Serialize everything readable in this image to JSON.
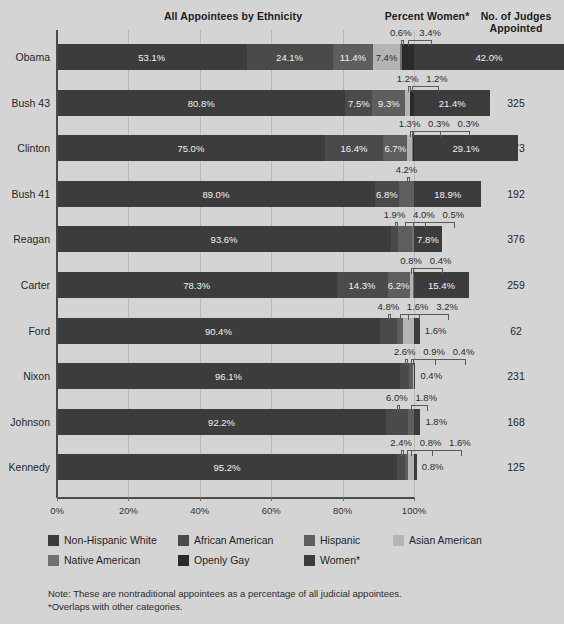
{
  "headers": {
    "ethnicity": "All Appointees by Ethnicity",
    "women": "Percent Women*",
    "judges_line1": "No. of Judges",
    "judges_line2": "Appointed"
  },
  "note": {
    "line1": "Note: These are nontraditional appointees as a percentage of all judicial appointees.",
    "line2": "*Overlaps with other categories."
  },
  "legend": [
    {
      "label": "Non-Hispanic White",
      "color": "#3c3c3c"
    },
    {
      "label": "African American",
      "color": "#4a4a4a"
    },
    {
      "label": "Hispanic",
      "color": "#5e5e5e"
    },
    {
      "label": "Asian American",
      "color": "#b4b4b4"
    },
    {
      "label": "Native American",
      "color": "#707070"
    },
    {
      "label": "Openly Gay",
      "color": "#2a2a2a"
    },
    {
      "label": "Women*",
      "color": "#3c3c3c"
    }
  ],
  "axis": {
    "ticks": [
      "0%",
      "20%",
      "40%",
      "60%",
      "80%",
      "100%"
    ],
    "values": [
      0,
      20,
      40,
      60,
      80,
      100
    ]
  },
  "chart_data": {
    "type": "bar",
    "title": "All Appointees by Ethnicity",
    "xlabel": "",
    "ylabel": "",
    "xlim": [
      0,
      100
    ],
    "grid": true,
    "legend_position": "bottom",
    "categories": [
      "Obama",
      "Bush 43",
      "Clinton",
      "Bush 41",
      "Reagan",
      "Carter",
      "Ford",
      "Nixon",
      "Johnson",
      "Kennedy"
    ],
    "series": [
      {
        "name": "Non-Hispanic White",
        "values": [
          53.1,
          80.8,
          75.0,
          89.0,
          93.6,
          78.3,
          90.4,
          96.1,
          92.2,
          95.2
        ]
      },
      {
        "name": "African American",
        "values": [
          24.1,
          7.5,
          16.4,
          6.8,
          1.9,
          14.3,
          4.8,
          2.6,
          6.0,
          2.4
        ]
      },
      {
        "name": "Hispanic",
        "values": [
          11.4,
          9.3,
          6.7,
          4.2,
          4.0,
          6.2,
          1.6,
          0.9,
          1.8,
          0.8
        ]
      },
      {
        "name": "Asian American",
        "values": [
          7.4,
          1.2,
          1.3,
          0.0,
          0.0,
          0.8,
          3.2,
          0.4,
          0.0,
          1.6
        ]
      },
      {
        "name": "Native American",
        "values": [
          0.6,
          0.0,
          0.3,
          0.0,
          0.5,
          0.4,
          0.0,
          0.0,
          0.0,
          0.0
        ]
      },
      {
        "name": "Openly Gay",
        "values": [
          3.4,
          1.2,
          0.3,
          0.0,
          0.0,
          0.0,
          0.0,
          0.0,
          0.0,
          0.0
        ]
      },
      {
        "name": "Women*",
        "values": [
          42.0,
          21.4,
          29.1,
          18.9,
          7.8,
          15.4,
          1.6,
          0.4,
          1.8,
          0.8
        ]
      }
    ],
    "judges_appointed": [
      329,
      325,
      373,
      192,
      376,
      259,
      62,
      231,
      168,
      125
    ]
  },
  "rows": [
    {
      "name": "Obama",
      "judges": "329",
      "segs": [
        {
          "label": "53.1%",
          "w": 53.1,
          "color": "#3c3c3c",
          "inside": true,
          "light": false
        },
        {
          "label": "24.1%",
          "w": 24.1,
          "color": "#4a4a4a",
          "inside": true,
          "light": false
        },
        {
          "label": "11.4%",
          "w": 11.4,
          "color": "#5e5e5e",
          "inside": true,
          "light": false
        },
        {
          "label": "7.4%",
          "w": 7.4,
          "color": "#b4b4b4",
          "inside": true,
          "light": true
        },
        {
          "label": "0.6%",
          "w": 0.6,
          "color": "#707070",
          "inside": false,
          "light": false
        },
        {
          "label": "3.4%",
          "w": 3.4,
          "color": "#2a2a2a",
          "inside": false,
          "light": false
        }
      ],
      "women": {
        "label": "42.0%",
        "w": 42.0,
        "inside": true
      }
    },
    {
      "name": "Bush 43",
      "judges": "325",
      "segs": [
        {
          "label": "80.8%",
          "w": 80.8,
          "color": "#3c3c3c",
          "inside": true,
          "light": false
        },
        {
          "label": "7.5%",
          "w": 7.5,
          "color": "#4a4a4a",
          "inside": true,
          "light": false
        },
        {
          "label": "9.3%",
          "w": 9.3,
          "color": "#5e5e5e",
          "inside": true,
          "light": false
        },
        {
          "label": "1.2%",
          "w": 1.2,
          "color": "#b4b4b4",
          "inside": false,
          "light": true
        },
        {
          "label": "1.2%",
          "w": 1.2,
          "color": "#2a2a2a",
          "inside": false,
          "light": false
        }
      ],
      "women": {
        "label": "21.4%",
        "w": 21.4,
        "inside": true
      }
    },
    {
      "name": "Clinton",
      "judges": "373",
      "segs": [
        {
          "label": "75.0%",
          "w": 75.0,
          "color": "#3c3c3c",
          "inside": true,
          "light": false
        },
        {
          "label": "16.4%",
          "w": 16.4,
          "color": "#4a4a4a",
          "inside": true,
          "light": false
        },
        {
          "label": "6.7%",
          "w": 6.7,
          "color": "#5e5e5e",
          "inside": true,
          "light": false
        },
        {
          "label": "1.3%",
          "w": 1.3,
          "color": "#b4b4b4",
          "inside": false,
          "light": true
        },
        {
          "label": "0.3%",
          "w": 0.3,
          "color": "#707070",
          "inside": false,
          "light": false
        },
        {
          "label": "0.3%",
          "w": 0.3,
          "color": "#2a2a2a",
          "inside": false,
          "light": false
        }
      ],
      "women": {
        "label": "29.1%",
        "w": 29.1,
        "inside": true
      }
    },
    {
      "name": "Bush 41",
      "judges": "192",
      "segs": [
        {
          "label": "89.0%",
          "w": 89.0,
          "color": "#3c3c3c",
          "inside": true,
          "light": false
        },
        {
          "label": "6.8%",
          "w": 6.8,
          "color": "#4a4a4a",
          "inside": true,
          "light": false
        },
        {
          "label": "4.2%",
          "w": 4.2,
          "color": "#5e5e5e",
          "inside": false,
          "light": false
        }
      ],
      "women": {
        "label": "18.9%",
        "w": 18.9,
        "inside": true
      }
    },
    {
      "name": "Reagan",
      "judges": "376",
      "segs": [
        {
          "label": "93.6%",
          "w": 93.6,
          "color": "#3c3c3c",
          "inside": true,
          "light": false
        },
        {
          "label": "1.9%",
          "w": 1.9,
          "color": "#4a4a4a",
          "inside": false,
          "light": false
        },
        {
          "label": "4.0%",
          "w": 4.0,
          "color": "#5e5e5e",
          "inside": false,
          "light": false
        },
        {
          "label": "0.5%",
          "w": 0.5,
          "color": "#707070",
          "inside": false,
          "light": false
        }
      ],
      "women": {
        "label": "7.8%",
        "w": 7.8,
        "inside": true
      }
    },
    {
      "name": "Carter",
      "judges": "259",
      "segs": [
        {
          "label": "78.3%",
          "w": 78.3,
          "color": "#3c3c3c",
          "inside": true,
          "light": false
        },
        {
          "label": "14.3%",
          "w": 14.3,
          "color": "#4a4a4a",
          "inside": true,
          "light": false
        },
        {
          "label": "6.2%",
          "w": 6.2,
          "color": "#5e5e5e",
          "inside": true,
          "light": false
        },
        {
          "label": "0.8%",
          "w": 0.8,
          "color": "#b4b4b4",
          "inside": false,
          "light": true
        },
        {
          "label": "0.4%",
          "w": 0.4,
          "color": "#707070",
          "inside": false,
          "light": false
        }
      ],
      "women": {
        "label": "15.4%",
        "w": 15.4,
        "inside": true
      }
    },
    {
      "name": "Ford",
      "judges": "62",
      "segs": [
        {
          "label": "90.4%",
          "w": 90.4,
          "color": "#3c3c3c",
          "inside": true,
          "light": false
        },
        {
          "label": "4.8%",
          "w": 4.8,
          "color": "#4a4a4a",
          "inside": false,
          "light": false
        },
        {
          "label": "1.6%",
          "w": 1.6,
          "color": "#5e5e5e",
          "inside": false,
          "light": false
        },
        {
          "label": "3.2%",
          "w": 3.2,
          "color": "#b4b4b4",
          "inside": false,
          "light": true
        }
      ],
      "women": {
        "label": "1.6%",
        "w": 1.6,
        "inside": false
      }
    },
    {
      "name": "Nixon",
      "judges": "231",
      "segs": [
        {
          "label": "96.1%",
          "w": 96.1,
          "color": "#3c3c3c",
          "inside": true,
          "light": false
        },
        {
          "label": "2.6%",
          "w": 2.6,
          "color": "#4a4a4a",
          "inside": false,
          "light": false
        },
        {
          "label": "0.9%",
          "w": 0.9,
          "color": "#5e5e5e",
          "inside": false,
          "light": false
        },
        {
          "label": "0.4%",
          "w": 0.4,
          "color": "#b4b4b4",
          "inside": false,
          "light": true
        }
      ],
      "women": {
        "label": "0.4%",
        "w": 0.4,
        "inside": false
      }
    },
    {
      "name": "Johnson",
      "judges": "168",
      "segs": [
        {
          "label": "92.2%",
          "w": 92.2,
          "color": "#3c3c3c",
          "inside": true,
          "light": false
        },
        {
          "label": "6.0%",
          "w": 6.0,
          "color": "#4a4a4a",
          "inside": false,
          "light": false
        },
        {
          "label": "1.8%",
          "w": 1.8,
          "color": "#5e5e5e",
          "inside": false,
          "light": false
        }
      ],
      "women": {
        "label": "1.8%",
        "w": 1.8,
        "inside": false
      }
    },
    {
      "name": "Kennedy",
      "judges": "125",
      "segs": [
        {
          "label": "95.2%",
          "w": 95.2,
          "color": "#3c3c3c",
          "inside": true,
          "light": false
        },
        {
          "label": "2.4%",
          "w": 2.4,
          "color": "#4a4a4a",
          "inside": false,
          "light": false
        },
        {
          "label": "0.8%",
          "w": 0.8,
          "color": "#5e5e5e",
          "inside": false,
          "light": false
        },
        {
          "label": "1.6%",
          "w": 1.6,
          "color": "#b4b4b4",
          "inside": false,
          "light": true
        }
      ],
      "women": {
        "label": "0.8%",
        "w": 0.8,
        "inside": false
      }
    }
  ]
}
